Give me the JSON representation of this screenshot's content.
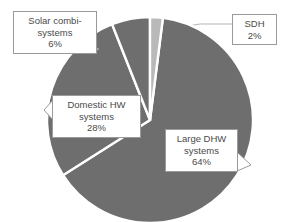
{
  "chart_data": {
    "type": "pie",
    "title": "",
    "categories": [
      "SDH",
      "Large DHW systems",
      "Domestic HW systems",
      "Solar combi-systems"
    ],
    "values": [
      2,
      64,
      28,
      6
    ],
    "unit": "%",
    "legend": "none",
    "grid": false,
    "slices": [
      {
        "name": "SDH",
        "label": "SDH",
        "percent": "2%",
        "value": 2,
        "color": "#b9b9b9",
        "start_angle": 0,
        "end_angle": 7.2
      },
      {
        "name": "Large DHW systems",
        "label_line1": "Large DHW",
        "label_line2": "systems",
        "percent": "64%",
        "value": 64,
        "color": "#6e6e6e",
        "start_angle": 7.2,
        "end_angle": 237.6
      },
      {
        "name": "Domestic HW systems",
        "label_line1": "Domestic HW",
        "label_line2": "systems",
        "percent": "28%",
        "value": 28,
        "color": "#6e6e6e",
        "start_angle": 237.6,
        "end_angle": 338.4
      },
      {
        "name": "Solar combi-systems",
        "label_line1": "Solar combi-",
        "label_line2": "systems",
        "percent": "6%",
        "value": 6,
        "color": "#6e6e6e",
        "start_angle": 338.4,
        "end_angle": 360
      }
    ]
  },
  "callouts": {
    "solar": {
      "line1": "Solar combi-",
      "line2": "systems",
      "percent": "6%"
    },
    "sdh": {
      "line1": "SDH",
      "percent": "2%"
    },
    "domestic": {
      "line1": "Domestic HW",
      "line2": "systems",
      "percent": "28%"
    },
    "large": {
      "line1": "Large DHW",
      "line2": "systems",
      "percent": "64%"
    }
  },
  "colors": {
    "slice_main": "#6e6e6e",
    "slice_light": "#b9b9b9",
    "gap": "#ffffff",
    "box_border": "#9a9a9a",
    "text": "#4a4a4a",
    "background": "#ffffff"
  }
}
